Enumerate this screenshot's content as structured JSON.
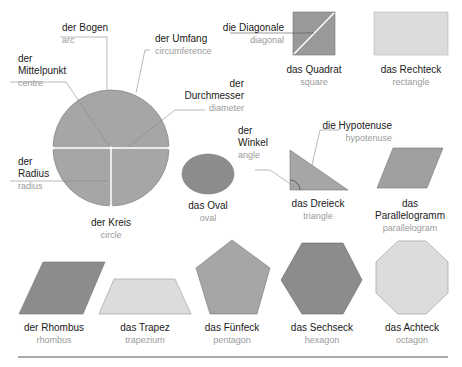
{
  "colors": {
    "dark_fill": "#8c8c8c",
    "mid_fill": "#a6a6a6",
    "light_fill": "#dcdcdc",
    "stroke": "#6e6e6e",
    "leader_line": "#8a8a8a",
    "white_line": "#ffffff",
    "german_text": "#1a1a1a",
    "english_text": "#9a9a9a",
    "rule": "#555555"
  },
  "circle": {
    "de": "der Kreis",
    "en": "circle",
    "parts": {
      "arc": {
        "de": "der Bogen",
        "en": "arc"
      },
      "circumference": {
        "de": "der Umfang",
        "en": "circumference"
      },
      "centre_l1": "der",
      "centre_l2": "Mittelpunkt",
      "centre_en": "centre",
      "diameter_l1": "der",
      "diameter_l2": "Durchmesser",
      "diameter_en": "diameter",
      "radius_l1": "der",
      "radius_l2": "Radius",
      "radius_en": "radius"
    }
  },
  "square": {
    "de": "das Quadrat",
    "en": "square",
    "diagonal": {
      "de": "die Diagonale",
      "en": "diagonal"
    }
  },
  "rectangle": {
    "de": "das Rechteck",
    "en": "rectangle"
  },
  "oval": {
    "de": "das Oval",
    "en": "oval"
  },
  "triangle": {
    "de": "das Dreieck",
    "en": "triangle",
    "angle_l1": "der",
    "angle_l2": "Winkel",
    "angle_en": "angle",
    "hypotenuse": {
      "de": "die Hypotenuse",
      "en": "hypotenuse"
    }
  },
  "parallelogram": {
    "de_l1": "das",
    "de_l2": "Parallelogramm",
    "en": "parallelogram"
  },
  "rhombus": {
    "de": "der Rhombus",
    "en": "rhombus"
  },
  "trapezium": {
    "de": "das Trapez",
    "en": "trapezium"
  },
  "pentagon": {
    "de": "das Fünfeck",
    "en": "pentagon"
  },
  "hexagon": {
    "de": "das Sechseck",
    "en": "hexagon"
  },
  "octagon": {
    "de": "das Achteck",
    "en": "octagon"
  }
}
